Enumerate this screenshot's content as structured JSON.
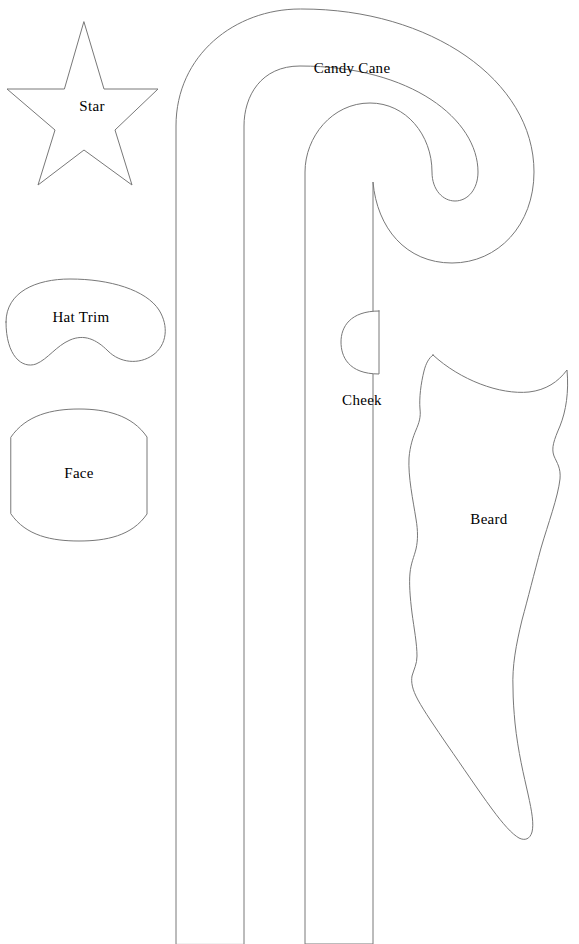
{
  "document": {
    "type": "craft-pattern-template-sheet",
    "background_color": "#ffffff",
    "outline_color": "#787878",
    "label_color": "#000000",
    "width": 579,
    "height": 944
  },
  "pieces": [
    {
      "id": "star",
      "label": "Star",
      "shape": "five-pointed-star",
      "label_x": 92,
      "label_y": 106,
      "bounds": {
        "x": 6,
        "y": 22,
        "width": 152,
        "height": 163
      }
    },
    {
      "id": "hat-trim",
      "label": "Hat Trim",
      "shape": "crescent-band",
      "label_x": 81,
      "label_y": 317,
      "bounds": {
        "x": 3,
        "y": 280,
        "width": 162,
        "height": 85
      }
    },
    {
      "id": "face",
      "label": "Face",
      "shape": "rounded-hexagon",
      "label_x": 79,
      "label_y": 473,
      "bounds": {
        "x": 10,
        "y": 410,
        "width": 138,
        "height": 130
      }
    },
    {
      "id": "candy-cane",
      "label": "Candy Cane",
      "shape": "hooked-cane",
      "label_x": 352,
      "label_y": 68,
      "bounds": {
        "x": 176,
        "y": 8,
        "width": 358,
        "height": 936
      }
    },
    {
      "id": "cheek",
      "label": "Cheek",
      "shape": "half-circle",
      "label_x": 362,
      "label_y": 400,
      "bounds": {
        "x": 341,
        "y": 311,
        "width": 39,
        "height": 63
      }
    },
    {
      "id": "beard",
      "label": "Beard",
      "shape": "tapered-wavy-beard",
      "label_x": 489,
      "label_y": 519,
      "bounds": {
        "x": 408,
        "y": 355,
        "width": 160,
        "height": 487
      }
    }
  ]
}
